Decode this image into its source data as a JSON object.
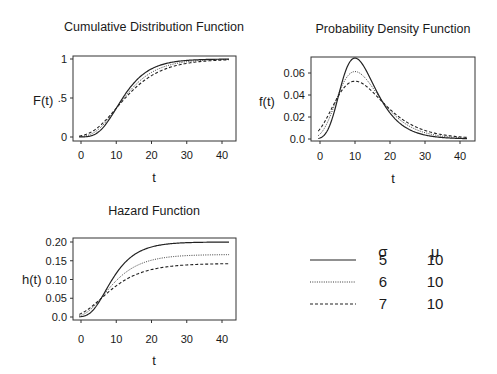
{
  "chart_data": [
    {
      "id": "cdf",
      "type": "line",
      "title": "Cumulative Distribution Function",
      "xlabel": "t",
      "ylabel": "F(t)",
      "xlim": [
        -2,
        43
      ],
      "ylim": [
        0,
        1
      ],
      "xticks": [
        0,
        10,
        20,
        30,
        40
      ],
      "yticks": [
        {
          "v": 0,
          "label": "0"
        },
        {
          "v": 0.5,
          "label": ".5"
        },
        {
          "v": 1,
          "label": "1"
        }
      ],
      "x": [
        0,
        5,
        10,
        15,
        20,
        25,
        30,
        35,
        40
      ],
      "series": [
        {
          "name": "sigma=5, mu=10",
          "style": "solid",
          "values": [
            0.001,
            0.066,
            0.368,
            0.692,
            0.873,
            0.951,
            0.982,
            0.993,
            0.998
          ]
        },
        {
          "name": "sigma=6, mu=10",
          "style": "dotted",
          "values": [
            0.005,
            0.1,
            0.368,
            0.646,
            0.828,
            0.921,
            0.965,
            0.984,
            0.993
          ]
        },
        {
          "name": "sigma=7, mu=10",
          "style": "dashed",
          "values": [
            0.015,
            0.126,
            0.368,
            0.614,
            0.788,
            0.891,
            0.944,
            0.972,
            0.986
          ]
        }
      ]
    },
    {
      "id": "pdf",
      "type": "line",
      "title": "Probability Density Function",
      "xlabel": "t",
      "ylabel": "f(t)",
      "xlim": [
        -2,
        43
      ],
      "ylim": [
        0,
        0.075
      ],
      "xticks": [
        0,
        10,
        20,
        30,
        40
      ],
      "yticks": [
        {
          "v": 0,
          "label": "0.0"
        },
        {
          "v": 0.02,
          "label": "0.02"
        },
        {
          "v": 0.04,
          "label": "0.04"
        },
        {
          "v": 0.06,
          "label": "0.06"
        }
      ],
      "x": [
        0,
        5,
        10,
        15,
        20,
        25,
        30,
        35,
        40
      ],
      "series": [
        {
          "name": "sigma=5, mu=10",
          "style": "solid",
          "values": [
            0.001,
            0.036,
            0.074,
            0.051,
            0.024,
            0.01,
            0.004,
            0.001,
            0.0005
          ]
        },
        {
          "name": "sigma=6, mu=10",
          "style": "dotted",
          "values": [
            0.004,
            0.038,
            0.061,
            0.048,
            0.027,
            0.013,
            0.006,
            0.003,
            0.001
          ]
        },
        {
          "name": "sigma=7, mu=10",
          "style": "dashed",
          "values": [
            0.009,
            0.038,
            0.053,
            0.045,
            0.028,
            0.016,
            0.008,
            0.004,
            0.002
          ]
        }
      ]
    },
    {
      "id": "hazard",
      "type": "line",
      "title": "Hazard Function",
      "xlabel": "t",
      "ylabel": "h(t)",
      "xlim": [
        -2,
        43
      ],
      "ylim": [
        0,
        0.2
      ],
      "xticks": [
        0,
        10,
        20,
        30,
        40
      ],
      "yticks": [
        {
          "v": 0,
          "label": "0.0"
        },
        {
          "v": 0.05,
          "label": "0.05"
        },
        {
          "v": 0.1,
          "label": "0.10"
        },
        {
          "v": 0.15,
          "label": "0.15"
        },
        {
          "v": 0.2,
          "label": "0.20"
        }
      ],
      "x": [
        0,
        5,
        10,
        15,
        20,
        25,
        30,
        35,
        40
      ],
      "series": [
        {
          "name": "sigma=5, mu=10",
          "style": "solid",
          "values": [
            0.001,
            0.039,
            0.116,
            0.167,
            0.189,
            0.197,
            0.199,
            0.2,
            0.2
          ]
        },
        {
          "name": "sigma=6, mu=10",
          "style": "dotted",
          "values": [
            0.004,
            0.043,
            0.097,
            0.135,
            0.154,
            0.162,
            0.165,
            0.166,
            0.166
          ]
        },
        {
          "name": "sigma=7, mu=10",
          "style": "dashed",
          "values": [
            0.009,
            0.044,
            0.084,
            0.115,
            0.131,
            0.138,
            0.141,
            0.142,
            0.143
          ]
        }
      ]
    }
  ],
  "params": {
    "mu": 10,
    "sigmas": [
      5,
      6,
      7
    ]
  },
  "legend": {
    "headers": {
      "sigma": "σ",
      "mu": "μ"
    },
    "rows": [
      {
        "style": "solid",
        "sigma": "5",
        "mu": "10"
      },
      {
        "style": "dotted",
        "sigma": "6",
        "mu": "10"
      },
      {
        "style": "dashed",
        "sigma": "7",
        "mu": "10"
      }
    ]
  },
  "colors": {
    "line": "#222222",
    "frame": "#333333",
    "background": "#ffffff"
  }
}
